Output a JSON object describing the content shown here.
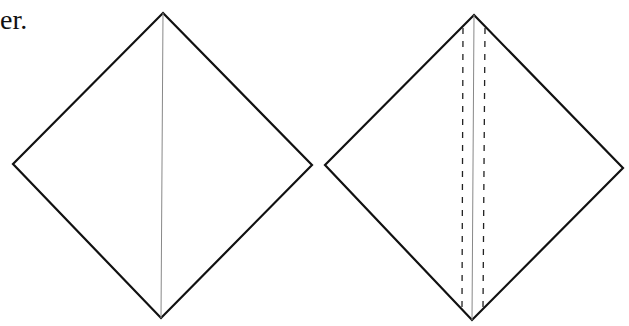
{
  "caption": {
    "text_fragment": "er."
  },
  "colors": {
    "outline": "#111111",
    "crease": "#888888",
    "dashed": "#222222",
    "background": "#ffffff"
  },
  "figures": [
    {
      "name": "left-diamond",
      "vertices": {
        "top": [
          163,
          13
        ],
        "right": [
          312,
          165
        ],
        "bottom": [
          161,
          318
        ],
        "left": [
          13,
          164
        ]
      },
      "lines": [
        {
          "type": "crease",
          "style": "solid-thin",
          "from": [
            163,
            13
          ],
          "to": [
            161,
            318
          ]
        }
      ]
    },
    {
      "name": "right-diamond",
      "vertices": {
        "top": [
          474,
          15
        ],
        "right": [
          623,
          168
        ],
        "bottom": [
          472,
          320
        ],
        "left": [
          325,
          165
        ]
      },
      "lines": [
        {
          "type": "crease",
          "style": "solid-thin",
          "from": [
            474,
            15
          ],
          "to": [
            472,
            320
          ]
        },
        {
          "type": "fold-guide",
          "style": "dashed",
          "from": [
            463,
            28
          ],
          "to": [
            462,
            308
          ]
        },
        {
          "type": "fold-guide",
          "style": "dashed",
          "from": [
            485,
            28
          ],
          "to": [
            483,
            308
          ]
        }
      ]
    }
  ]
}
